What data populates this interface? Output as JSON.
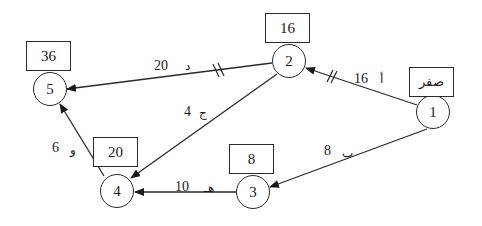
{
  "diagram": {
    "type": "activity-network",
    "nodes": [
      {
        "id": "1",
        "label": "1",
        "earliest_time": "صفر"
      },
      {
        "id": "2",
        "label": "2",
        "earliest_time": "16"
      },
      {
        "id": "3",
        "label": "3",
        "earliest_time": "8"
      },
      {
        "id": "4",
        "label": "4",
        "earliest_time": "20"
      },
      {
        "id": "5",
        "label": "5",
        "earliest_time": "36"
      }
    ],
    "edges": [
      {
        "from": "1",
        "to": "2",
        "activity": "أ",
        "duration": "16",
        "critical": true
      },
      {
        "from": "1",
        "to": "3",
        "activity": "ب",
        "duration": "8",
        "critical": false
      },
      {
        "from": "2",
        "to": "4",
        "activity": "ج",
        "duration": "4",
        "critical": false
      },
      {
        "from": "2",
        "to": "5",
        "activity": "د",
        "duration": "20",
        "critical": true
      },
      {
        "from": "3",
        "to": "4",
        "activity": "هـ",
        "duration": "10",
        "critical": false
      },
      {
        "from": "4",
        "to": "5",
        "activity": "و",
        "duration": "6",
        "critical": false
      }
    ]
  }
}
